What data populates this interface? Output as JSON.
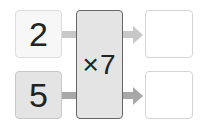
{
  "diagram": {
    "type": "function-machine",
    "inputs": [
      {
        "value": "2"
      },
      {
        "value": "5"
      }
    ],
    "operation": {
      "label": "×7"
    },
    "outputs": [
      {
        "value": ""
      },
      {
        "value": ""
      }
    ],
    "colors": {
      "input_top_fill": "#f7f7f7",
      "input_bottom_fill": "#e4e4e4",
      "operation_fill": "#e4e4e4",
      "operation_border": "#666666",
      "arrow_top": "#c8c8c8",
      "arrow_bottom": "#a8a8a8",
      "output_border": "#d4d4d4"
    }
  }
}
